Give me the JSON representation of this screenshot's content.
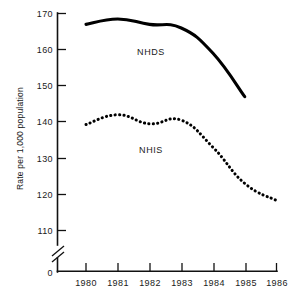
{
  "chart_data": {
    "type": "line",
    "title": "",
    "subtitle": "",
    "xlabel": "",
    "ylabel": "Rate per 1,000 population",
    "x": [
      1980,
      1981,
      1982,
      1983,
      1984,
      1985,
      1986
    ],
    "categories": [
      "1980",
      "1981",
      "1982",
      "1983",
      "1984",
      "1985",
      "1986"
    ],
    "xtick_labels": [
      "1980",
      "1981",
      "1982",
      "1983",
      "1984",
      "1985",
      "1986"
    ],
    "ytick_labels": [
      "170",
      "160",
      "150",
      "140",
      "130",
      "120",
      "110",
      "0"
    ],
    "ytick_values": [
      170,
      160,
      150,
      140,
      130,
      120,
      110,
      0
    ],
    "ylim": [
      110,
      170
    ],
    "xlim": [
      1980,
      1986
    ],
    "grid": false,
    "legend": "inline-annotations",
    "axis_break": true,
    "axis_break_note": "y-axis broken between 0 and 110",
    "series": [
      {
        "name": "NHDS",
        "style": "solid",
        "label": "NHDS",
        "color": "#000000",
        "x": [
          1980,
          1981,
          1982,
          1983,
          1984,
          1985
        ],
        "values": [
          167.0,
          168.5,
          167.0,
          166.0,
          159.0,
          147.0
        ]
      },
      {
        "name": "NHIS",
        "style": "dotted",
        "label": "NHIS",
        "color": "#000000",
        "x": [
          1980,
          1981,
          1982,
          1983,
          1984,
          1985,
          1986
        ],
        "values": [
          139.3,
          142.0,
          139.5,
          140.5,
          133.0,
          123.0,
          118.3
        ]
      }
    ],
    "annotations": [
      {
        "text": "NHDS",
        "x": 1982.0,
        "y": 160.5
      },
      {
        "text": "NHIS",
        "x": 1982.0,
        "y": 133.5
      }
    ]
  }
}
